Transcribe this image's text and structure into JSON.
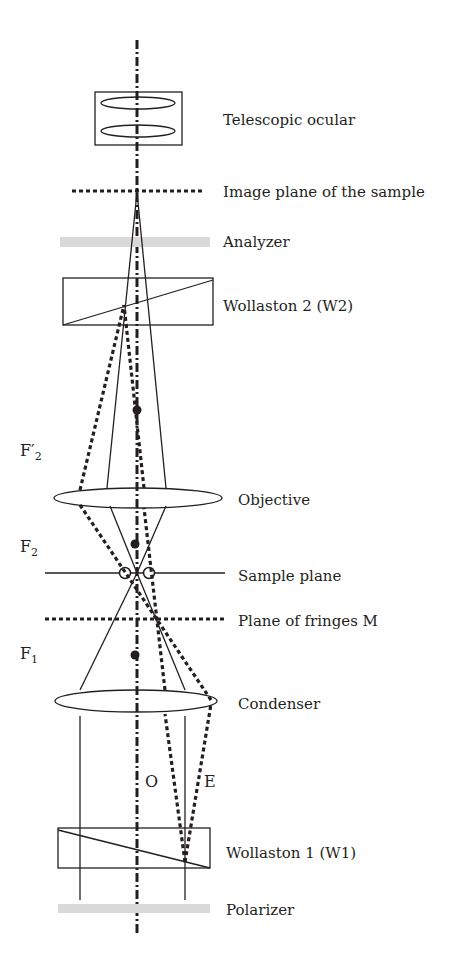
{
  "diagram": {
    "components": [
      {
        "id": "telescopic_ocular",
        "label": "Telescopic ocular"
      },
      {
        "id": "image_plane",
        "label": "Image plane of the sample"
      },
      {
        "id": "analyzer",
        "label": "Analyzer"
      },
      {
        "id": "wollaston2",
        "label": "Wollaston 2 (W2)"
      },
      {
        "id": "objective",
        "label": "Objective"
      },
      {
        "id": "sample_plane",
        "label": "Sample plane"
      },
      {
        "id": "fringes_plane",
        "label": "Plane of fringes M"
      },
      {
        "id": "condenser",
        "label": "Condenser"
      },
      {
        "id": "wollaston1",
        "label": "Wollaston 1 (W1)"
      },
      {
        "id": "polarizer",
        "label": "Polarizer"
      }
    ],
    "focal_points": {
      "f2_prime": {
        "main": "F′",
        "sub": "2"
      },
      "f2": {
        "main": "F",
        "sub": "2"
      },
      "f1": {
        "main": "F",
        "sub": "1"
      }
    },
    "rays": {
      "ordinary": "O",
      "extraordinary": "E"
    }
  }
}
